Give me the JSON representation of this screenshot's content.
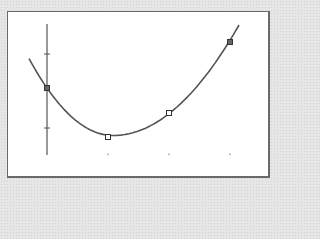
{
  "chart_data": {
    "type": "scatter",
    "title": "",
    "xlabel": "",
    "ylabel": "",
    "grid": false,
    "legend": null,
    "x_ticks": [
      0,
      1,
      2,
      3
    ],
    "y_ticks": [
      1,
      -1
    ],
    "xlim": [
      -0.3,
      3.15
    ],
    "ylim": [
      -2.2,
      2.2
    ],
    "series": [
      {
        "name": "data points",
        "marker": "square",
        "x": [
          0,
          1,
          2,
          3
        ],
        "y": [
          0,
          -1.6,
          -0.8,
          1.5
        ]
      },
      {
        "name": "quadratic fit",
        "style": "line",
        "description": "Parabolic fit curve through points, minimum near x≈1.1",
        "x": [
          -0.3,
          0,
          0.5,
          1,
          1.1,
          1.5,
          2,
          2.5,
          3,
          3.15
        ],
        "y": [
          0.8,
          0,
          -1.0,
          -1.53,
          -1.55,
          -1.4,
          -0.75,
          0.3,
          1.5,
          2.0
        ]
      }
    ]
  },
  "colors": {
    "line": "#555555",
    "marker": "#333333",
    "frame": "#6a6a6a",
    "background": "#e6e6e6",
    "plot_bg": "#ffffff"
  }
}
